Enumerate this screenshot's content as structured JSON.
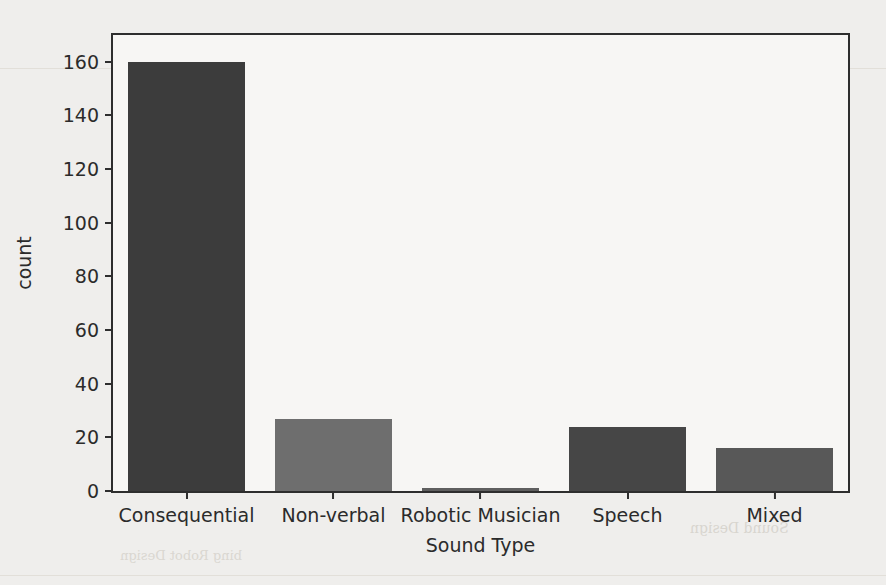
{
  "chart_data": {
    "type": "bar",
    "title": "",
    "xlabel": "Sound Type",
    "ylabel": "count",
    "categories": [
      "Consequential",
      "Non-verbal",
      "Robotic Musician",
      "Speech",
      "Mixed"
    ],
    "values": [
      160,
      27,
      1,
      24,
      16
    ],
    "bar_colors": [
      "#3c3c3c",
      "#6e6e6e",
      "#5f5f5f",
      "#464646",
      "#585858"
    ],
    "ylim": [
      0,
      170
    ],
    "yticks": [
      0,
      20,
      40,
      60,
      80,
      100,
      120,
      140,
      160
    ],
    "ytick_labels": [
      "0",
      "20",
      "40",
      "60",
      "80",
      "100",
      "120",
      "140",
      "160"
    ],
    "grid": false,
    "legend": null,
    "axes_frame_color": "#2e2e2e",
    "plot_background": "#f7f6f4"
  },
  "page": {
    "background": "#efeeec",
    "bleed_through": {
      "title_line_1": "The Landscape of Sound in",
      "title_line_2": "Robotics",
      "subtitle": "Anna Rovera Rael    and  Kelly Fuhrer",
      "footer_right": "Sound Design",
      "footer_left": "bing    Robot Design"
    }
  }
}
